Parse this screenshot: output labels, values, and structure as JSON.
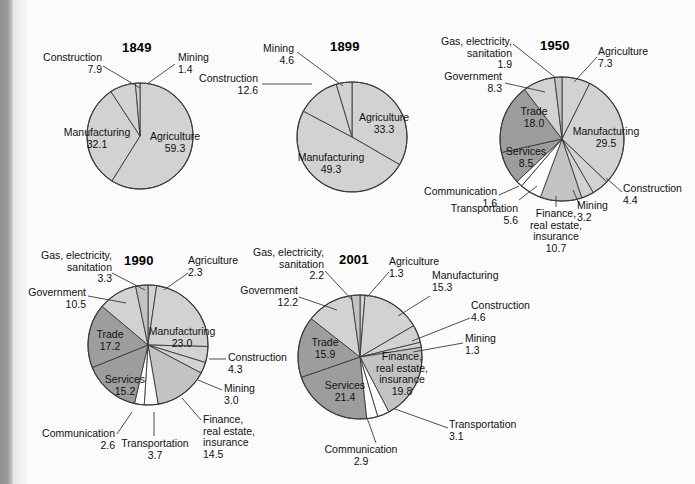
{
  "figure": {
    "background_color": "#fbfbfb",
    "slice_colors": {
      "light": "#d2d2d2",
      "medium": "#c3c3c3",
      "dark": "#9d9d9d",
      "white": "#fdfdfd",
      "outline": "#3a3a3a"
    }
  },
  "chart_data": [
    {
      "type": "pie",
      "title": "1849",
      "categories": [
        "Agriculture",
        "Manufacturing",
        "Construction",
        "Mining"
      ],
      "values": [
        59.3,
        32.1,
        7.9,
        1.4
      ],
      "labels": [
        "Agriculture\n59.3",
        "Manufacturing\n32.1",
        "Construction\n7.9",
        "Mining\n1.4"
      ],
      "xlabel": "",
      "ylabel": "",
      "grid": false,
      "legend": "none"
    },
    {
      "type": "pie",
      "title": "1899",
      "categories": [
        "Agriculture",
        "Manufacturing",
        "Construction",
        "Mining"
      ],
      "values": [
        33.3,
        49.3,
        12.6,
        4.6
      ],
      "labels": [
        "Agriculture\n33.3",
        "Manufacturing\n49.3",
        "Construction\n12.6",
        "Mining\n4.6"
      ],
      "xlabel": "",
      "ylabel": "",
      "grid": false,
      "legend": "none"
    },
    {
      "type": "pie",
      "title": "1950",
      "categories": [
        "Agriculture",
        "Manufacturing",
        "Construction",
        "Mining",
        "Finance, real estate, insurance",
        "Transportation",
        "Communication",
        "Services",
        "Trade",
        "Government",
        "Gas, electricity, sanitation"
      ],
      "values": [
        7.3,
        29.5,
        4.4,
        3.2,
        10.7,
        5.6,
        1.6,
        8.5,
        18.0,
        8.3,
        1.9
      ],
      "labels": [
        "Agriculture\n7.3",
        "Manufacturing\n29.5",
        "Construction\n4.4",
        "Mining\n3.2",
        "Finance,\nreal estate,\ninsurance\n10.7",
        "Transportation\n5.6",
        "Communication\n1.6",
        "Services\n8.5",
        "Trade\n18.0",
        "Government\n8.3",
        "Gas, electricity,\nsanitation\n1.9"
      ],
      "xlabel": "",
      "ylabel": "",
      "grid": false,
      "legend": "none"
    },
    {
      "type": "pie",
      "title": "1990",
      "categories": [
        "Agriculture",
        "Manufacturing",
        "Construction",
        "Mining",
        "Finance, real estate, insurance",
        "Transportation",
        "Communication",
        "Services",
        "Trade",
        "Government",
        "Gas, electricity, sanitation"
      ],
      "values": [
        2.3,
        23.0,
        4.3,
        3.0,
        14.5,
        3.7,
        2.6,
        15.2,
        17.2,
        10.5,
        3.3
      ],
      "labels": [
        "Agriculture\n2.3",
        "Manufacturing\n23.0",
        "Construction\n4.3",
        "Mining\n3.0",
        "Finance,\nreal estate,\ninsurance\n14.5",
        "Transportation\n3.7",
        "Communication\n2.6",
        "Services\n15.2",
        "Trade\n17.2",
        "Government\n10.5",
        "Gas, electricity,\nsanitation\n3.3"
      ],
      "xlabel": "",
      "ylabel": "",
      "grid": false,
      "legend": "none"
    },
    {
      "type": "pie",
      "title": "2001",
      "categories": [
        "Agriculture",
        "Manufacturing",
        "Construction",
        "Mining",
        "Finance, real estate, insurance",
        "Transportation",
        "Communication",
        "Services",
        "Trade",
        "Government",
        "Gas, electricity, sanitation"
      ],
      "values": [
        1.3,
        15.3,
        4.6,
        1.3,
        19.8,
        3.1,
        2.9,
        21.4,
        15.9,
        12.2,
        2.2
      ],
      "labels": [
        "Agriculture\n1.3",
        "Manufacturing\n15.3",
        "Construction\n4.6",
        "Mining\n1.3",
        "Finance,\nreal estate,\ninsurance\n19.8",
        "Transportation\n3.1",
        "Communication\n2.9",
        "Services\n21.4",
        "Trade\n15.9",
        "Government\n12.2",
        "Gas, electricity,\nsanitation\n2.2"
      ],
      "xlabel": "",
      "ylabel": "",
      "grid": false,
      "legend": "none"
    }
  ],
  "charts": {
    "c1849": {
      "title": "1849",
      "agriculture": "Agriculture\n59.3",
      "manufacturing": "Manufacturing\n32.1",
      "construction": "Construction\n7.9",
      "mining": "Mining\n1.4"
    },
    "c1899": {
      "title": "1899",
      "agriculture": "Agriculture\n33.3",
      "manufacturing": "Manufacturing\n49.3",
      "construction": "Construction\n12.6",
      "mining": "Mining\n4.6"
    },
    "c1950": {
      "title": "1950",
      "agriculture": "Agriculture\n7.3",
      "manufacturing": "Manufacturing\n29.5",
      "construction": "Construction\n4.4",
      "mining": "Mining\n3.2",
      "finance": "Finance,\nreal estate,\ninsurance\n10.7",
      "transportation": "Transportation\n5.6",
      "communication": "Communication\n1.6",
      "services": "Services\n8.5",
      "trade": "Trade\n18.0",
      "government": "Government\n8.3",
      "gas": "Gas, electricity,\nsanitation\n1.9"
    },
    "c1990": {
      "title": "1990",
      "agriculture": "Agriculture\n2.3",
      "manufacturing": "Manufacturing\n23.0",
      "construction": "Construction\n4.3",
      "mining": "Mining\n3.0",
      "finance": "Finance,\nreal estate,\ninsurance\n14.5",
      "transportation": "Transportation\n3.7",
      "communication": "Communication\n2.6",
      "services": "Services\n15.2",
      "trade": "Trade\n17.2",
      "government": "Government\n10.5",
      "gas": "Gas, electricity,\nsanitation\n3.3"
    },
    "c2001": {
      "title": "2001",
      "agriculture": "Agriculture\n1.3",
      "manufacturing": "Manufacturing\n15.3",
      "construction": "Construction\n4.6",
      "mining": "Mining\n1.3",
      "finance": "Finance,\nreal estate,\ninsurance\n19.8",
      "transportation": "Transportation\n3.1",
      "communication": "Communication\n2.9",
      "services": "Services\n21.4",
      "trade": "Trade\n15.9",
      "government": "Government\n12.2",
      "gas": "Gas, electricity,\nsanitation\n2.2"
    }
  }
}
